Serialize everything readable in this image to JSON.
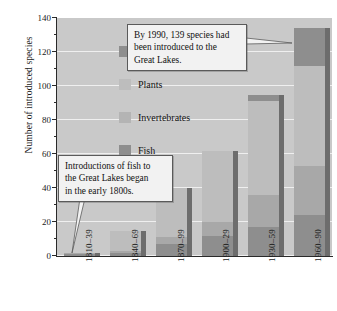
{
  "chart_data": {
    "type": "bar",
    "subtype": "stacked-bar",
    "title": "",
    "xlabel": "",
    "ylabel": "Number of introduced species",
    "ylim": [
      0,
      140
    ],
    "ytick_step": 20,
    "yminor_step": 10,
    "grid": true,
    "legend_position": "inside-top-left",
    "categories": [
      "1810–39",
      "1840–69",
      "1870–99",
      "1900–29",
      "1930–59",
      "1960–90"
    ],
    "yticks": [
      "0",
      "20",
      "40",
      "60",
      "80",
      "100",
      "120",
      "140"
    ],
    "series": [
      {
        "name": "Fish",
        "color": "#8e8e8e",
        "values": [
          1,
          2,
          7,
          12,
          17,
          24
        ]
      },
      {
        "name": "Invertebrates",
        "color": "#a8a8a8",
        "values": [
          1,
          1,
          4,
          8,
          19,
          29
        ]
      },
      {
        "name": "Plants",
        "color": "#bdbdbd",
        "values": [
          0,
          12,
          29,
          42,
          55,
          59
        ]
      },
      {
        "name": "Algae",
        "color": "#8e8e8e",
        "values": [
          0,
          0,
          0,
          0,
          4,
          22
        ]
      }
    ],
    "totals": [
      2,
      15,
      40,
      62,
      95,
      134
    ],
    "annotations": [
      {
        "id": "callout-1990",
        "lines": [
          "By 1990, 139 species had",
          "been introduced to the",
          "Great Lakes."
        ],
        "points_to": "1960–90 bar top"
      },
      {
        "id": "callout-fish",
        "lines": [
          "Introductions of fish to",
          "the Great Lakes began",
          "in the early 1800s."
        ],
        "points_to": "1810–39 bar"
      }
    ]
  },
  "legend": {
    "items": [
      {
        "label": "Algae",
        "color": "#8e8e8e"
      },
      {
        "label": "Plants",
        "color": "#bdbdbd"
      },
      {
        "label": "Invertebrates",
        "color": "#b4b4b4"
      },
      {
        "label": "Fish",
        "color": "#8e8e8e"
      }
    ]
  },
  "axes": {
    "y_title": "Number of introduced species"
  },
  "colors": {
    "plot_background": "#c9c9c9",
    "gridline": "#efefef",
    "axis": "#2a2a2a",
    "callout_fill": "#f2f2f2",
    "callout_border": "#5a5a5a",
    "bar_side": "#6d6d6d"
  }
}
